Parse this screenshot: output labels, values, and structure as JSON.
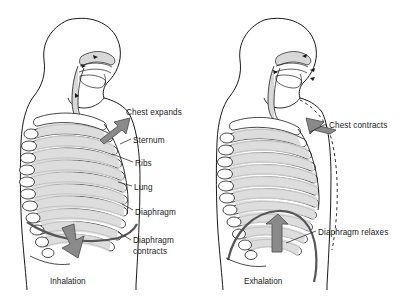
{
  "figure": {
    "background_color": "#ffffff",
    "line_color": "#1a1a1a",
    "arrow_fill": "#8a8a8a",
    "arrow_stroke": "#555555",
    "shade_color": "#d8d8d8",
    "width": 408,
    "height": 301
  },
  "panels": [
    {
      "id": "inhalation",
      "caption": "Inhalation",
      "labels": [
        {
          "name": "chest-expands",
          "text": "Chest expands",
          "x": 126,
          "y": 107
        },
        {
          "name": "sternum",
          "text": "Sternum",
          "x": 133,
          "y": 135
        },
        {
          "name": "ribs",
          "text": "Ribs",
          "x": 135,
          "y": 158
        },
        {
          "name": "lung",
          "text": "Lung",
          "x": 134,
          "y": 182
        },
        {
          "name": "diaphragm",
          "text": "Diaphragm",
          "x": 135,
          "y": 207
        },
        {
          "name": "diaphragm-contracts",
          "text": "Diaphragm\ncontracts",
          "x": 133,
          "y": 235
        }
      ],
      "arrows": [
        {
          "name": "chest-expand-arrow",
          "direction": "up-right",
          "meaning": "rib cage moves up and out"
        },
        {
          "name": "diaphragm-contract-arrow",
          "direction": "down",
          "meaning": "diaphragm flattens downward"
        }
      ],
      "airflow": "inward",
      "caption_x": 50,
      "caption_y": 277
    },
    {
      "id": "exhalation",
      "caption": "Exhalation",
      "labels": [
        {
          "name": "chest-contracts",
          "text": "Chest contracts",
          "x": 329,
          "y": 120
        },
        {
          "name": "diaphragm-relaxes",
          "text": "Diaphragm relaxes",
          "x": 318,
          "y": 227
        }
      ],
      "arrows": [
        {
          "name": "chest-contract-arrow",
          "direction": "down-left",
          "meaning": "rib cage moves down and in"
        },
        {
          "name": "diaphragm-relax-arrow",
          "direction": "up",
          "meaning": "diaphragm domes upward"
        }
      ],
      "airflow": "outward",
      "dashed_outline": "previous expanded chest position",
      "caption_x": 244,
      "caption_y": 277
    }
  ],
  "anatomy_parts": [
    "head",
    "nasal cavity",
    "oral cavity",
    "tongue",
    "pharynx",
    "larynx",
    "trachea",
    "sternum",
    "ribs",
    "vertebrae",
    "lung",
    "diaphragm",
    "torso outline"
  ]
}
